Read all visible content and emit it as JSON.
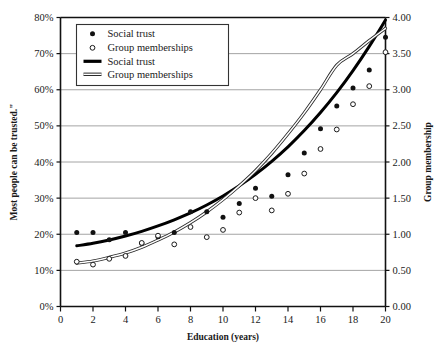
{
  "chart_data": {
    "type": "scatter",
    "title": "",
    "xlabel": "Education (years)",
    "ylabel_left": "Most  people can be trusted.\"",
    "ylabel_right": "Group membership",
    "xlim": [
      0,
      20
    ],
    "ylim_left": [
      0,
      0.8
    ],
    "ylim_right": [
      0,
      4.0
    ],
    "grid": true,
    "grid_axis": "y",
    "xticks": [
      0,
      2,
      4,
      6,
      8,
      10,
      12,
      14,
      16,
      18,
      20
    ],
    "xtick_labels": [
      "0",
      "2",
      "4",
      "6",
      "8",
      "10",
      "12",
      "14",
      "16",
      "18",
      "20"
    ],
    "yticks_left": [
      0,
      0.1,
      0.2,
      0.3,
      0.4,
      0.5,
      0.6,
      0.7,
      0.8
    ],
    "ytick_labels_left": [
      "0%",
      "10%",
      "20%",
      "30%",
      "40%",
      "50%",
      "60%",
      "70%",
      "80%"
    ],
    "yticks_right": [
      0,
      0.5,
      1.0,
      1.5,
      2.0,
      2.5,
      3.0,
      3.5,
      4.0
    ],
    "ytick_labels_right": [
      "0.00",
      "0.50",
      "1.00",
      "1.50",
      "2.00",
      "2.50",
      "3.00",
      "3.50",
      "4.00"
    ],
    "legend_position": "upper-left",
    "legend_entries": [
      {
        "label": "Social trust",
        "marker": "filled-circle",
        "kind": "marker"
      },
      {
        "label": "Group memberships",
        "marker": "open-circle",
        "kind": "marker"
      },
      {
        "label": "Social trust",
        "marker": "thick-line",
        "kind": "line"
      },
      {
        "label": "Group memberships",
        "marker": "double-line",
        "kind": "line"
      }
    ],
    "series": [
      {
        "name": "Social trust",
        "kind": "scatter",
        "axis": "left",
        "marker": "filled-circle",
        "color": "#111111",
        "x": [
          1,
          2,
          3,
          4,
          5,
          6,
          7,
          8,
          9,
          10,
          11,
          12,
          13,
          14,
          15,
          16,
          17,
          18,
          19,
          20
        ],
        "y": [
          0.205,
          0.205,
          0.185,
          0.205,
          0.175,
          0.193,
          0.205,
          0.262,
          0.262,
          0.247,
          0.285,
          0.327,
          0.305,
          0.365,
          0.425,
          0.492,
          0.555,
          0.605,
          0.655,
          0.745
        ]
      },
      {
        "name": "Group memberships",
        "kind": "scatter",
        "axis": "right",
        "marker": "open-circle",
        "color": "#111111",
        "x": [
          1,
          2,
          3,
          4,
          5,
          6,
          7,
          8,
          9,
          10,
          11,
          12,
          13,
          14,
          15,
          16,
          17,
          18,
          19,
          20
        ],
        "y": [
          0.62,
          0.58,
          0.66,
          0.7,
          0.88,
          0.98,
          0.86,
          1.1,
          0.96,
          1.06,
          1.3,
          1.5,
          1.33,
          1.56,
          1.84,
          2.18,
          2.45,
          2.8,
          3.05,
          3.52
        ]
      },
      {
        "name": "Social trust",
        "kind": "fit-line",
        "axis": "left",
        "color": "#000000",
        "x": [
          1,
          2,
          3,
          4,
          5,
          6,
          7,
          8,
          9,
          10,
          11,
          12,
          13,
          14,
          15,
          16,
          17,
          18,
          19,
          20
        ],
        "y": [
          0.168,
          0.175,
          0.184,
          0.195,
          0.208,
          0.223,
          0.24,
          0.259,
          0.281,
          0.306,
          0.334,
          0.366,
          0.402,
          0.442,
          0.487,
          0.537,
          0.592,
          0.653,
          0.72,
          0.793
        ]
      },
      {
        "name": "Group memberships",
        "kind": "fit-line",
        "axis": "right",
        "color": "#6f6f6f",
        "x": [
          1,
          2,
          3,
          4,
          5,
          6,
          7,
          8,
          9,
          10,
          11,
          12,
          13,
          14,
          15,
          16,
          17,
          18,
          19,
          20
        ],
        "y": [
          0.6,
          0.63,
          0.68,
          0.74,
          0.82,
          0.92,
          1.03,
          1.16,
          1.31,
          1.48,
          1.67,
          1.88,
          2.12,
          2.39,
          2.68,
          3.0,
          3.34,
          3.5,
          3.68,
          3.85
        ]
      }
    ]
  },
  "colors": {
    "axis": "#111111",
    "grid": "#9a9a9a",
    "trust_line": "#000000",
    "group_line": "#6f6f6f",
    "background": "#ffffff"
  }
}
